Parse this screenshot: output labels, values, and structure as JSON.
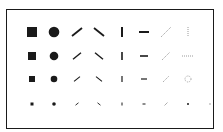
{
  "figure": {
    "colors": {
      "ink": "#1a1a1a",
      "light_ink": "#9a9a9a",
      "frame": "#1a1a1a",
      "background": "#ffffff"
    },
    "columns": [
      "square",
      "circle",
      "slash",
      "backslash",
      "vertical-bar",
      "horizontal-bar",
      "thin-diagonal",
      "dotted"
    ],
    "column_x": [
      31,
      53,
      76,
      98,
      121,
      143,
      165,
      187
    ],
    "rows": [
      {
        "size": 10,
        "y": 31,
        "dotted_variant": "dotted-vertical-line"
      },
      {
        "size": 8,
        "y": 55,
        "dotted_variant": "dotted-horizontal-line"
      },
      {
        "size": 6,
        "y": 78,
        "dotted_variant": "dotted-circle"
      },
      {
        "size": 3,
        "y": 103,
        "dotted_variant": "dot"
      }
    ]
  }
}
